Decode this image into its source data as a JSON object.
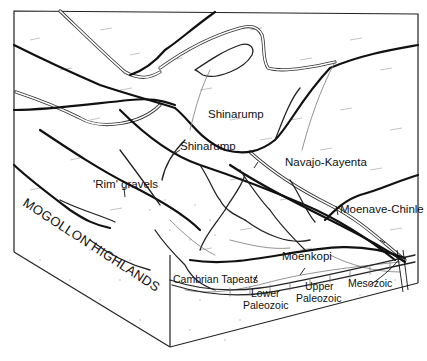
{
  "diagram": {
    "type": "geological block diagram",
    "labels": {
      "shinarump_upper": "Shinarump",
      "shinarump_lower": "Shinarump",
      "navajo_kayenta": "Navajo-Kayenta",
      "rim_gravels": "'Rim' gravels",
      "mogollon_highlands": "MOGOLLON HIGHLANDS",
      "moenave_chinle": "Moenave-Chinle",
      "moenkopi": "Moenkopi",
      "cambrian_tapeats": "Cambrian Tapeats",
      "lower_paleozoic_1": "Lower",
      "lower_paleozoic_2": "Paleozoic",
      "upper_paleozoic_1": "Upper",
      "upper_paleozoic_2": "Paleozoic",
      "mesozoic": "Mesozoic"
    },
    "colors": {
      "line": "#111111",
      "background": "#ffffff",
      "texture": "#aaaaaa"
    }
  }
}
